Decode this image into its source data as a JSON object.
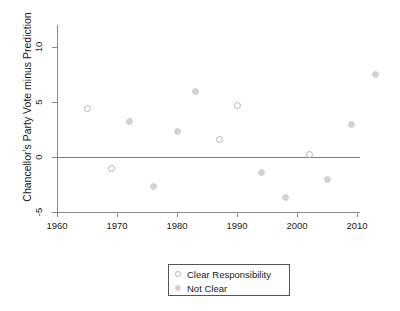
{
  "chart_data": {
    "type": "scatter",
    "title": "",
    "xlabel": "",
    "ylabel": "Chancellor's Party Vote minus Prediction",
    "xlim": [
      1960,
      2015
    ],
    "ylim": [
      -5,
      10
    ],
    "xticks": [
      1960,
      1970,
      1980,
      1990,
      2000,
      2010
    ],
    "xtick_labels": [
      "1960",
      "1970",
      "1980",
      "1990",
      "2000",
      "2010"
    ],
    "yticks": [
      -5,
      0,
      5,
      10
    ],
    "ytick_labels": [
      "-5",
      "0",
      "5",
      "10"
    ],
    "grid": false,
    "reference_line_y": 0,
    "legend_position": "bottom-center",
    "series": [
      {
        "name": "Clear Responsibility",
        "marker": "open-circle",
        "color": "#b6b6b6",
        "points": [
          {
            "x": 1965,
            "y": 4.4
          },
          {
            "x": 1969,
            "y": -1.0
          },
          {
            "x": 1987,
            "y": 1.6
          },
          {
            "x": 1990,
            "y": 4.7
          },
          {
            "x": 2002,
            "y": 0.2
          }
        ]
      },
      {
        "name": "Not Clear",
        "marker": "filled-circle",
        "color": "#d2d2d2",
        "points": [
          {
            "x": 1972,
            "y": 3.2
          },
          {
            "x": 1976,
            "y": -2.7
          },
          {
            "x": 1980,
            "y": 2.3
          },
          {
            "x": 1983,
            "y": 6.0
          },
          {
            "x": 1994,
            "y": -1.4
          },
          {
            "x": 1998,
            "y": -3.7
          },
          {
            "x": 2005,
            "y": -2.0
          },
          {
            "x": 2009,
            "y": 3.0
          },
          {
            "x": 2013,
            "y": 7.5
          }
        ]
      }
    ]
  },
  "legend": {
    "entries": [
      {
        "label": "Clear Responsibility",
        "marker": "open-circle"
      },
      {
        "label": "Not Clear",
        "marker": "filled-circle"
      }
    ]
  }
}
